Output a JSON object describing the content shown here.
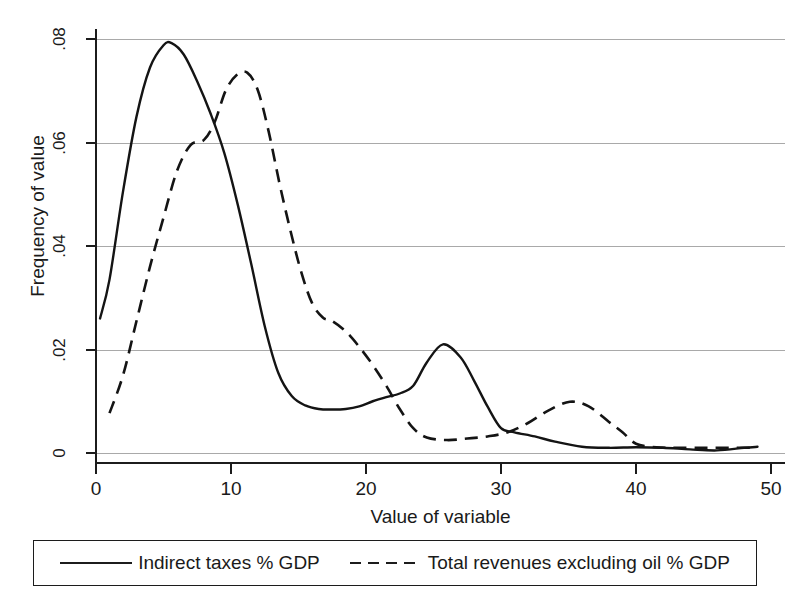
{
  "chart_data": {
    "type": "line",
    "title": "",
    "xlabel": "Value of variable",
    "ylabel": "Frequency of value",
    "xlim": [
      0,
      50
    ],
    "ylim": [
      0,
      0.08
    ],
    "xticks": [
      0,
      10,
      20,
      30,
      40,
      50
    ],
    "xtick_labels": [
      "0",
      "10",
      "20",
      "30",
      "40",
      "50"
    ],
    "yticks": [
      0,
      0.02,
      0.04,
      0.06,
      0.08
    ],
    "ytick_labels": [
      "0",
      ".02",
      ".04",
      ".06",
      ".08"
    ],
    "grid": "horizontal",
    "legend_position": "below-axes",
    "series": [
      {
        "name": "Indirect taxes % GDP",
        "style": "solid",
        "color": "#141414",
        "x": [
          0.3,
          1.0,
          2.0,
          3.0,
          4.0,
          5.0,
          5.6,
          6.5,
          7.5,
          8.5,
          9.5,
          10.5,
          11.5,
          12.5,
          13.5,
          14.5,
          15.5,
          16.5,
          17.5,
          18.5,
          19.5,
          20.5,
          21.5,
          22.5,
          23.5,
          24.5,
          25.7,
          27.0,
          28.0,
          29.0,
          30.0,
          31.0,
          32.5,
          34.0,
          36.0,
          38.0,
          40.0,
          42.0,
          44.0,
          46.0,
          48.0,
          49.0
        ],
        "y": [
          0.026,
          0.0335,
          0.0505,
          0.065,
          0.0745,
          0.0788,
          0.0792,
          0.077,
          0.0718,
          0.0655,
          0.058,
          0.048,
          0.0365,
          0.0245,
          0.0155,
          0.011,
          0.0092,
          0.0085,
          0.0084,
          0.0085,
          0.009,
          0.01,
          0.0108,
          0.0115,
          0.013,
          0.0175,
          0.021,
          0.0185,
          0.014,
          0.009,
          0.0048,
          0.004,
          0.0032,
          0.0022,
          0.0012,
          0.001,
          0.0011,
          0.001,
          0.0007,
          0.0005,
          0.001,
          0.0012
        ]
      },
      {
        "name": "Total revenues excluding oil % GDP",
        "style": "dashed",
        "color": "#141414",
        "x": [
          1.0,
          2.0,
          3.0,
          4.0,
          5.0,
          6.0,
          7.0,
          8.0,
          8.8,
          9.6,
          10.4,
          11.2,
          12.0,
          12.8,
          13.6,
          14.4,
          15.2,
          16.0,
          16.8,
          17.5,
          18.5,
          19.5,
          20.5,
          21.5,
          22.5,
          23.5,
          24.5,
          26.0,
          27.5,
          29.0,
          30.5,
          32.0,
          33.5,
          35.1,
          36.5,
          38.0,
          39.0,
          40.0,
          41.5,
          43.0,
          45.0,
          47.0,
          48.5
        ],
        "y": [
          0.0077,
          0.015,
          0.0255,
          0.036,
          0.0455,
          0.0545,
          0.0595,
          0.0605,
          0.064,
          0.07,
          0.073,
          0.0735,
          0.07,
          0.062,
          0.052,
          0.043,
          0.035,
          0.029,
          0.0262,
          0.0255,
          0.0235,
          0.0205,
          0.017,
          0.013,
          0.0085,
          0.0048,
          0.003,
          0.0025,
          0.0028,
          0.0032,
          0.004,
          0.0058,
          0.0082,
          0.0099,
          0.009,
          0.006,
          0.004,
          0.0018,
          0.0011,
          0.001,
          0.001,
          0.001,
          0.001
        ]
      }
    ]
  },
  "legend": {
    "entries": [
      {
        "label": "Indirect taxes % GDP",
        "style": "solid"
      },
      {
        "label": "Total revenues excluding oil % GDP",
        "style": "dashed"
      }
    ]
  }
}
